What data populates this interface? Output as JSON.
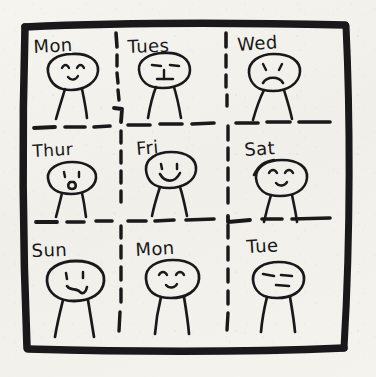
{
  "drawing": {
    "title": "Hand-drawn nine-panel week mood grid",
    "media": "ink on paper",
    "paper_color": "#f3f1ec",
    "ink_color": "#19181a",
    "grid": {
      "rows": 3,
      "cols": 3,
      "border_style": "thick hand-drawn square",
      "divider_style": "dashed"
    }
  },
  "cells": [
    {
      "id": "cell-mon-1",
      "label": "Mon",
      "row": 1,
      "col": 1,
      "label_x": 34,
      "label_y": 52,
      "label_rotate": -3,
      "label_size": 18,
      "figure": {
        "cx": 72,
        "cy": 75,
        "rx": 26,
        "ry": 17,
        "expression": "happy-closed-eyes",
        "mouth": "small-smile",
        "eyes": "curved-closed",
        "leg_spread": 13,
        "leg_len": 32
      }
    },
    {
      "id": "cell-tues",
      "label": "Tues",
      "row": 1,
      "col": 2,
      "label_x": 128,
      "label_y": 52,
      "label_rotate": -2,
      "label_size": 18,
      "figure": {
        "cx": 163,
        "cy": 73,
        "rx": 27,
        "ry": 17,
        "expression": "neutral",
        "mouth": "straight",
        "eyes": "dash",
        "leg_spread": 14,
        "leg_len": 33
      }
    },
    {
      "id": "cell-wed",
      "label": "Wed",
      "row": 1,
      "col": 3,
      "label_x": 240,
      "label_y": 50,
      "label_rotate": -4,
      "label_size": 18,
      "figure": {
        "cx": 274,
        "cy": 74,
        "rx": 26,
        "ry": 18,
        "expression": "sad",
        "mouth": "frown",
        "eyes": "dot",
        "leg_spread": 14,
        "leg_len": 32
      }
    },
    {
      "id": "cell-thur",
      "label": "Thur",
      "row": 2,
      "col": 1,
      "label_x": 34,
      "label_y": 157,
      "label_rotate": -3,
      "label_size": 17,
      "figure": {
        "cx": 72,
        "cy": 178,
        "rx": 25,
        "ry": 15,
        "expression": "surprised",
        "mouth": "open-oh",
        "eyes": "dot",
        "leg_spread": 13,
        "leg_len": 30
      }
    },
    {
      "id": "cell-fri",
      "label": "Fri",
      "row": 2,
      "col": 2,
      "label_x": 138,
      "label_y": 155,
      "label_rotate": -4,
      "label_size": 18,
      "figure": {
        "cx": 170,
        "cy": 172,
        "rx": 26,
        "ry": 17,
        "expression": "happy-big-smile",
        "mouth": "big-smile",
        "eyes": "dot",
        "leg_spread": 14,
        "leg_len": 33
      }
    },
    {
      "id": "cell-sat",
      "label": "Sat",
      "row": 2,
      "col": 3,
      "label_x": 246,
      "label_y": 155,
      "label_rotate": -4,
      "label_size": 18,
      "figure": {
        "cx": 281,
        "cy": 178,
        "rx": 26,
        "ry": 17,
        "expression": "content-closed-eyes",
        "mouth": "small-smile",
        "eyes": "curved-closed",
        "leg_spread": 14,
        "leg_len": 32
      }
    },
    {
      "id": "cell-sun",
      "label": "Sun",
      "row": 3,
      "col": 1,
      "label_x": 33,
      "label_y": 257,
      "label_rotate": -2,
      "label_size": 18,
      "figure": {
        "cx": 75,
        "cy": 280,
        "rx": 28,
        "ry": 18,
        "expression": "wry-smirk",
        "mouth": "squiggle",
        "eyes": "dot",
        "leg_spread": 16,
        "leg_len": 36
      }
    },
    {
      "id": "cell-mon-2",
      "label": "Mon",
      "row": 3,
      "col": 2,
      "label_x": 137,
      "label_y": 256,
      "label_rotate": -3,
      "label_size": 18,
      "figure": {
        "cx": 172,
        "cy": 278,
        "rx": 26,
        "ry": 17,
        "expression": "content-closed-eyes",
        "mouth": "small-smile",
        "eyes": "curved-closed",
        "leg_spread": 15,
        "leg_len": 35
      }
    },
    {
      "id": "cell-tue",
      "label": "Tue",
      "row": 3,
      "col": 3,
      "label_x": 248,
      "label_y": 253,
      "label_rotate": -3,
      "label_size": 18,
      "figure": {
        "cx": 278,
        "cy": 278,
        "rx": 25,
        "ry": 16,
        "expression": "flat-unimpressed",
        "mouth": "short-flat",
        "eyes": "dash",
        "leg_spread": 14,
        "leg_len": 33
      }
    }
  ]
}
